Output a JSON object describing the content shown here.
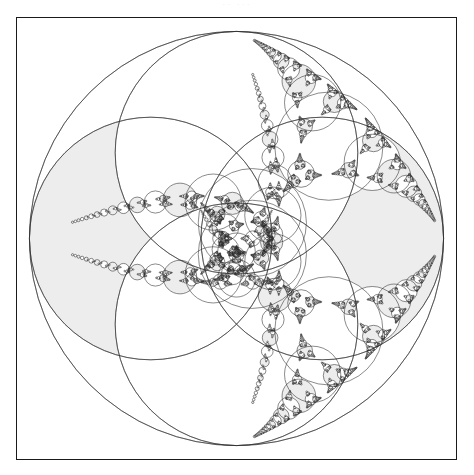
{
  "figure": {
    "title_artifact": "··  ···",
    "caption": "",
    "frame": {
      "x": 16,
      "y": 17,
      "width": 441,
      "height": 443,
      "border_color": "#1a1a1a",
      "border_width": 1.5,
      "background": "#ffffff"
    }
  },
  "chart_data": {
    "type": "scatter",
    "subtitle": "",
    "xlabel": "",
    "ylabel": "",
    "xlim": [
      -1,
      1
    ],
    "ylim": [
      -1,
      1
    ],
    "grid": false,
    "legend": "none",
    "annotations": [],
    "render": {
      "fill_gray": "#ededed",
      "fill_white": "#ffffff",
      "stroke": "#2b2b2b",
      "stroke_width": 0.55,
      "background": "#ffffff",
      "min_radius_px": 0.55,
      "max_depth": 14,
      "viewbox": "-1.06 -1.06 2.12 2.12",
      "scale_px_per_unit": 208
    },
    "outer_circle": {
      "cx": 0,
      "cy": 0,
      "r": 1,
      "bend": -1,
      "filled": false,
      "stroke": "#2b2b2b"
    },
    "seed_circles": [
      {
        "name": "left-large",
        "cx": -0.4142135624,
        "cy": 0,
        "r": 0.5857864376,
        "bend": 1.7071067812,
        "fill": "gray"
      },
      {
        "name": "right-large",
        "cx": 0.4142135624,
        "cy": 0,
        "r": 0.5857864376,
        "bend": 1.7071067812,
        "fill": "gray"
      },
      {
        "name": "top-large",
        "cx": 0,
        "cy": -0.4142135624,
        "r": 0.5857864376,
        "bend": 1.7071067812,
        "fill": "white"
      },
      {
        "name": "bottom-large",
        "cx": 0,
        "cy": 0.4142135624,
        "r": 0.5857864376,
        "bend": 1.7071067812,
        "fill": "white"
      }
    ],
    "series": [
      {
        "name": "outer boundary",
        "count": 1
      },
      {
        "name": "primary circles (gray)",
        "count": 2
      },
      {
        "name": "primary circles (white)",
        "count": 2
      },
      {
        "name": "recursive descendants",
        "count": "thousands"
      }
    ],
    "notes": [
      "Four mutually tangent unit-family circles inscribed in a bounding circle of radius 1.",
      "Tangency cusps appear at top-center and bottom-center of the bounding circle.",
      "Curvilinear triangles are recursively filled using the Descartes Circle Theorem.",
      "Alternating fill: descendants inherit a gray or white tint by generation parity."
    ]
  }
}
